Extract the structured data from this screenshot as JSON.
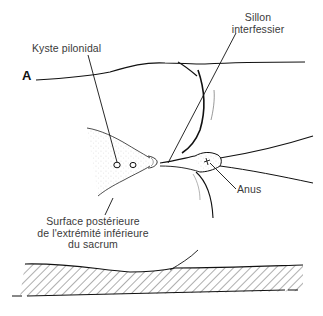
{
  "figure": {
    "panel_letter": "A",
    "labels": {
      "kyste": "Kyste pilonidal",
      "sillon_line1": "Sillon",
      "sillon_line2": "interfessier",
      "anus": "Anus",
      "surface_line1": "Surface postérieure",
      "surface_line2": "de l'extrémité inférieure",
      "surface_line3": "du sacrum"
    },
    "colors": {
      "line": "#111111",
      "text": "#3a3a3a",
      "background": "#ffffff"
    }
  }
}
